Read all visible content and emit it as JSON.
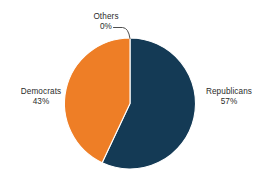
{
  "background_color": "#ffffff",
  "text_color": "#2b2b2b",
  "leader_line_color": "#3a3a3a",
  "chart_data": {
    "type": "pie",
    "title": "",
    "subtitle": "",
    "xlabel": "",
    "ylabel": "",
    "grid": false,
    "legend_position": "none",
    "label_format": "{name}\n{percent}%",
    "start_angle_deg": 0,
    "direction": "clockwise",
    "categories": [
      "Republicans",
      "Democrats",
      "Others"
    ],
    "values": [
      57,
      43,
      0
    ],
    "colors": [
      "#143a55",
      "#ee7e26",
      "#ffffff"
    ],
    "slices": [
      {
        "name": "Republicans",
        "percent": 57,
        "percent_label": "57%",
        "color": "#143a55",
        "label_position": "right-outside",
        "has_leader_line": false
      },
      {
        "name": "Democrats",
        "percent": 43,
        "percent_label": "43%",
        "color": "#ee7e26",
        "label_position": "left-outside",
        "has_leader_line": false
      },
      {
        "name": "Others",
        "percent": 0,
        "percent_label": "0%",
        "color": "#ffffff",
        "label_position": "top-outside",
        "has_leader_line": true
      }
    ]
  },
  "labels": {
    "others": {
      "name": "Others",
      "percent_label": "0%"
    },
    "democrats": {
      "name": "Democrats",
      "percent_label": "43%"
    },
    "republicans": {
      "name": "Republicans",
      "percent_label": "57%"
    }
  }
}
